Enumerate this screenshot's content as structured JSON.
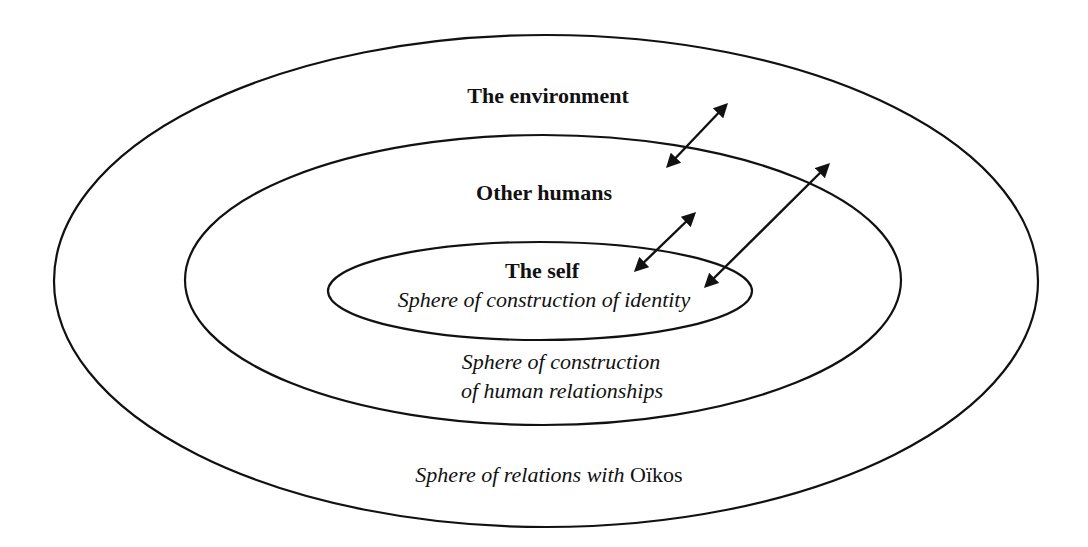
{
  "diagram": {
    "type": "nested-spheres",
    "stroke_color": "#111111",
    "background_color": "#ffffff",
    "spheres": [
      {
        "id": "outer",
        "title": "The environment",
        "caption_prefix": "Sphere of relations with ",
        "caption_suffix": "Oïkos"
      },
      {
        "id": "middle",
        "title": "Other humans",
        "caption_line1": "Sphere of construction",
        "caption_line2": "of human relationships"
      },
      {
        "id": "inner",
        "title": "The self",
        "caption": "Sphere of construction of identity"
      }
    ],
    "arrows": [
      {
        "from": "other-humans",
        "to": "environment",
        "type": "bidirectional"
      },
      {
        "from": "self",
        "to": "other-humans",
        "type": "bidirectional"
      },
      {
        "from": "self",
        "to": "environment",
        "type": "bidirectional"
      }
    ]
  }
}
